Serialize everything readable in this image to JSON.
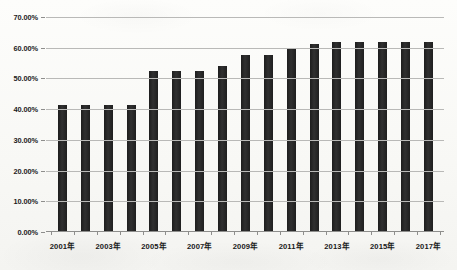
{
  "chart_data": {
    "type": "bar",
    "title": "",
    "subtitle": "",
    "xlabel": "",
    "ylabel": "",
    "categories": [
      "2001年",
      "2002年",
      "2003年",
      "2004年",
      "2005年",
      "2006年",
      "2007年",
      "2008年",
      "2009年",
      "2010年",
      "2011年",
      "2012年",
      "2013年",
      "2014年",
      "2015年",
      "2016年",
      "2017年"
    ],
    "visible_tick_labels": [
      "2001年",
      "2003年",
      "2005年",
      "2007年",
      "2009年",
      "2011年",
      "2013年",
      "2015年",
      "2017年"
    ],
    "values": [
      41.3,
      41.3,
      41.3,
      41.3,
      52.5,
      52.5,
      52.5,
      54.0,
      57.5,
      57.5,
      60.0,
      61.3,
      61.8,
      61.8,
      61.8,
      61.8,
      61.8
    ],
    "value_unit": "%",
    "ylim": [
      0,
      70
    ],
    "ytick_values": [
      0,
      10,
      20,
      30,
      40,
      50,
      60,
      70
    ],
    "ytick_labels": [
      "0.00%",
      "10.00%",
      "20.00%",
      "30.00%",
      "40.00%",
      "50.00%",
      "60.00%",
      "70.00%"
    ],
    "grid": true,
    "grid_axis": "y",
    "legend": false,
    "legend_position": "none",
    "series": [
      {
        "name": "",
        "values": [
          41.3,
          41.3,
          41.3,
          41.3,
          52.5,
          52.5,
          52.5,
          54.0,
          57.5,
          57.5,
          60.0,
          61.3,
          61.8,
          61.8,
          61.8,
          61.8,
          61.8
        ]
      }
    ],
    "colors": {
      "bar": "#262626",
      "gridline": "#b9b9b7",
      "axis": "#8e8e8c",
      "text": "#1b1b1b",
      "background": "#fbfbf9"
    }
  }
}
